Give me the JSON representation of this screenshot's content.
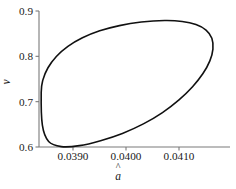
{
  "chart_data": {
    "type": "line",
    "title": "",
    "xlabel": "â",
    "ylabel": "ν",
    "xlabel_base": "a",
    "xlabel_accent": "^",
    "grid": false,
    "legend": null,
    "xlim": [
      0.03835,
      0.04175
    ],
    "ylim": [
      0.5956,
      0.9
    ],
    "xticks": [
      0.039,
      0.04,
      0.041
    ],
    "xtick_labels": [
      "0.0390",
      "0.0400",
      "0.0410"
    ],
    "yticks": [
      0.6,
      0.7,
      0.8,
      0.9
    ],
    "ytick_labels": [
      "0.6",
      "0.7",
      "0.8",
      "0.9"
    ],
    "series": [
      {
        "name": "limit-cycle-orbit",
        "closed": true,
        "color": "#111111",
        "linewidth": 1.6,
        "x": [
          0.0384,
          0.038432,
          0.038528,
          0.038686,
          0.038904,
          0.039178,
          0.039504,
          0.039876,
          0.040288,
          0.04073,
          0.04106,
          0.04132,
          0.04151,
          0.04162,
          0.04164,
          0.041582,
          0.041452,
          0.041256,
          0.041,
          0.040688,
          0.040328,
          0.039932,
          0.03952,
          0.03912,
          0.03878,
          0.03854,
          0.038422,
          0.0384
        ],
        "y": [
          0.72,
          0.748,
          0.7748,
          0.7996,
          0.8218,
          0.8408,
          0.8562,
          0.8678,
          0.8756,
          0.879,
          0.877,
          0.87,
          0.858,
          0.84,
          0.816,
          0.79,
          0.762,
          0.733,
          0.704,
          0.676,
          0.651,
          0.63,
          0.614,
          0.603,
          0.6008,
          0.612,
          0.648,
          0.72
        ]
      }
    ],
    "axis_color": "#7a7a7a",
    "curve_color": "#111111",
    "background": "#ffffff"
  },
  "axes": {
    "x_axis_name": "x-axis",
    "y_axis_name": "y-axis"
  }
}
